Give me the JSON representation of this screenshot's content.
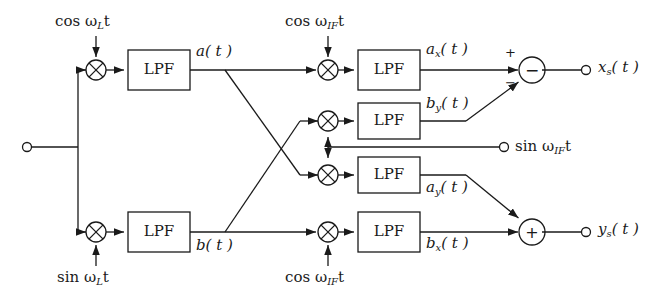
{
  "diagram": {
    "stroke_color": "#1a1a1a",
    "background_color": "#ffffff",
    "filter_label": "LPF",
    "inputs": [
      {
        "name": "rf-input",
        "label": "",
        "x": 27,
        "y": 147
      }
    ],
    "oscillators": {
      "lo_cos": "cos ω<sub>L</sub>t",
      "lo_sin": "sin ω<sub>L</sub>t",
      "if_cos_top": "cos ω<sub>IF</sub>t",
      "if_cos_bottom": "cos ω<sub>IF</sub>t",
      "if_sin": "sin ω<sub>IF</sub>t"
    },
    "signals": {
      "a": "a( t )",
      "b": "b( t )",
      "ax": "a<sub>x</sub>( t )",
      "by": "b<sub>y</sub>( t )",
      "ay": "a<sub>y</sub>( t )",
      "bx": "b<sub>x</sub>( t )"
    },
    "outputs": {
      "xs": "x<sub>s</sub>( t )",
      "ys": "y<sub>s</sub>( t )"
    },
    "summing_nodes": {
      "top": {
        "glyph": "−",
        "plus_sign": "+",
        "minus_sign": "−"
      },
      "bottom": {
        "glyph": "+"
      }
    },
    "mixer_glyph": "⊗",
    "filters": [
      {
        "name": "lpf-i",
        "label": "LPF",
        "x": 128,
        "y": 50,
        "w": 62,
        "h": 40
      },
      {
        "name": "lpf-q",
        "label": "LPF",
        "x": 128,
        "y": 212,
        "w": 62,
        "h": 40
      },
      {
        "name": "lpf-ax",
        "label": "LPF",
        "x": 358,
        "y": 50,
        "w": 62,
        "h": 40
      },
      {
        "name": "lpf-by",
        "label": "LPF",
        "x": 358,
        "y": 103,
        "w": 62,
        "h": 36
      },
      {
        "name": "lpf-ay",
        "label": "LPF",
        "x": 358,
        "y": 157,
        "w": 62,
        "h": 36
      },
      {
        "name": "lpf-bx",
        "label": "LPF",
        "x": 358,
        "y": 212,
        "w": 62,
        "h": 40
      }
    ],
    "rows": {
      "top": 70,
      "mid_upper": 121,
      "if_bus": 147,
      "mid_lower": 175,
      "bottom": 232
    }
  }
}
